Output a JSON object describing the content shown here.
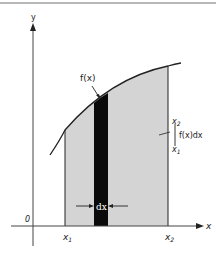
{
  "diagram": {
    "axes": {
      "y_label": "y",
      "x_label": "x",
      "origin_label": "0"
    },
    "curve_label": "f(x)",
    "strip_label": "dx",
    "bounds": {
      "lower": "x",
      "lower_sub": "1",
      "upper": "x",
      "upper_sub": "2"
    },
    "integral": {
      "upper_limit": "x",
      "upper_limit_sub": "2",
      "lower_limit": "x",
      "lower_limit_sub": "1",
      "integrand": "f(x)dx"
    },
    "colors": {
      "shaded_area": "#d4d4d4",
      "strip": "#0a0a0a",
      "lines": "#222222"
    }
  }
}
